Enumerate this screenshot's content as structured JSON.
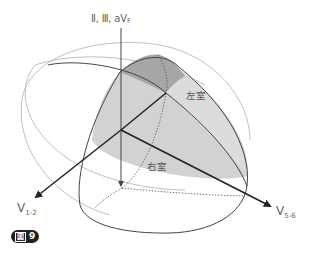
{
  "figure": {
    "badge": {
      "kanji": "図",
      "number": "9"
    },
    "axes": {
      "vertical": {
        "label_main": "Ⅱ, Ⅲ, aV",
        "label_sub": "F"
      },
      "left": {
        "label_main": "V",
        "label_sub": "1-2"
      },
      "right": {
        "label_main": "V",
        "label_sub": "5-6"
      }
    },
    "regions": {
      "left_ventricle": "左室",
      "right_ventricle": "右室"
    },
    "colors": {
      "axis": "#222222",
      "outline": "#444444",
      "outer_ellipse": "#aaaaaa",
      "shade_light": "#d0d0d0",
      "shade_dark": "#a8a8a8",
      "label": "#666666"
    }
  }
}
